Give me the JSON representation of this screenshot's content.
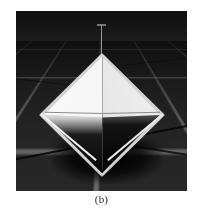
{
  "figure": {
    "caption": "(b)",
    "panel": {
      "scene_name": "3d-octahedron-render",
      "background_description": "dark perspective grid floor",
      "object_description": "white octahedron (bipyramid) with bright upper pyramid and shadowed black lower pyramid",
      "rod_description": "thin vertical rod above apex",
      "shadow_description": "dark cast shadow on grid floor"
    },
    "colors": {
      "page_background": "#ffffff",
      "panel_background": "#2a2a2a",
      "grid_line": "#bebebe",
      "solid_highlight": "#fbfbfb",
      "solid_shadow": "#000000",
      "caption_text": "#2b2b2b"
    }
  }
}
